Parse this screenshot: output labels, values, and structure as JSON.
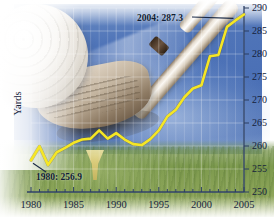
{
  "chart_data": {
    "type": "line",
    "title": "",
    "xlabel": "",
    "ylabel": "Yards",
    "xlim": [
      1980,
      2005
    ],
    "ylim": [
      250,
      290
    ],
    "grid": true,
    "legend": "none",
    "series": [
      {
        "name": "Average driving distance",
        "color": "#f5e625",
        "x": [
          1980,
          1981,
          1982,
          1983,
          1984,
          1985,
          1986,
          1987,
          1988,
          1989,
          1990,
          1991,
          1992,
          1993,
          1994,
          1995,
          1996,
          1997,
          1998,
          1999,
          2000,
          2001,
          2002,
          2003,
          2004,
          2005
        ],
        "values": [
          256.9,
          259.9,
          255.9,
          258.6,
          259.6,
          260.7,
          261.4,
          261.6,
          263.4,
          261.6,
          262.8,
          261.4,
          260.4,
          260.2,
          261.5,
          263.4,
          266.4,
          267.9,
          270.6,
          272.5,
          273.2,
          279.5,
          279.8,
          285.9,
          287.3,
          288.6
        ]
      }
    ],
    "yticks": [
      250,
      255,
      260,
      265,
      270,
      275,
      280,
      285,
      290
    ],
    "xticks": [
      1980,
      1985,
      1990,
      1995,
      2000,
      2005
    ],
    "x_minor_step": 1,
    "annotations": [
      {
        "id": "anno-top",
        "label": "2004: 287.3",
        "x": 2004,
        "y": 287.3
      },
      {
        "id": "anno-bot",
        "label": "1980: 256.9",
        "x": 1980,
        "y": 256.9
      }
    ],
    "axis_position": {
      "y_axis": "right",
      "x_axis": "bottom"
    }
  },
  "axis": {
    "y_title": "Yards",
    "y_ticks": [
      "290",
      "285",
      "280",
      "275",
      "270",
      "265",
      "260",
      "255",
      "250"
    ],
    "x_ticks": [
      "1980",
      "1985",
      "1990",
      "1995",
      "2000",
      "2005"
    ]
  },
  "annotations": {
    "top": "2004: 287.3",
    "bottom": "1980: 256.9"
  },
  "colors": {
    "series": "#f5e625",
    "axis": "#2c3f63",
    "text": "#16233c",
    "sky": "#4f74b8",
    "grass": "#7d9a4e"
  },
  "imagery": {
    "ball": "golf-ball",
    "club": "golf-club-iron",
    "tee": "golf-tee",
    "background": "sky-and-grass"
  }
}
